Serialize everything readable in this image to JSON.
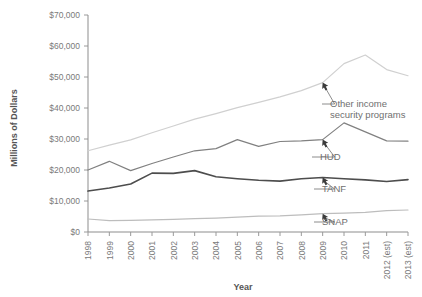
{
  "chart_data": {
    "type": "line",
    "title": "",
    "xlabel": "Year",
    "ylabel": "Millions of Dollars",
    "categories": [
      "1998",
      "1999",
      "2000",
      "2001",
      "2002",
      "2003",
      "2004",
      "2005",
      "2006",
      "2007",
      "2008",
      "2009",
      "2010",
      "2011",
      "2012 (est)",
      "2013 (est)"
    ],
    "x": [
      1998,
      1999,
      2000,
      2001,
      2002,
      2003,
      2004,
      2005,
      2006,
      2007,
      2008,
      2009,
      2010,
      2011,
      2012,
      2013
    ],
    "ylim": [
      0,
      70000
    ],
    "xlim": [
      1998,
      2013
    ],
    "ytick_labels": [
      "$0",
      "$10,000",
      "$20,000",
      "$30,000",
      "$40,000",
      "$50,000",
      "$60,000",
      "$70,000"
    ],
    "ytick_values": [
      0,
      10000,
      20000,
      30000,
      40000,
      50000,
      60000,
      70000
    ],
    "grid": false,
    "legend": "none",
    "annotations_position": "inline-callouts",
    "series": [
      {
        "name": "Other income security programs",
        "color": "#d0d0d0",
        "width": 1.2,
        "values": [
          26200,
          28000,
          29700,
          32000,
          34200,
          36400,
          38200,
          40100,
          41800,
          43600,
          45600,
          48200,
          54300,
          57100,
          52400,
          50400
        ]
      },
      {
        "name": "HUD",
        "color": "#808080",
        "width": 1.2,
        "values": [
          20000,
          22800,
          19800,
          22100,
          24200,
          26200,
          26900,
          29800,
          27600,
          29200,
          29400,
          29800,
          35200,
          32300,
          29400,
          29300
        ]
      },
      {
        "name": "TANF",
        "color": "#4d4d4d",
        "width": 1.6,
        "values": [
          13200,
          14200,
          15500,
          19000,
          18900,
          19800,
          17800,
          17200,
          16700,
          16400,
          17200,
          17600,
          17200,
          16800,
          16300,
          16900
        ]
      },
      {
        "name": "SNAP",
        "color": "#bdbdbd",
        "width": 1.2,
        "values": [
          4200,
          3700,
          3750,
          3900,
          4100,
          4300,
          4500,
          4800,
          5100,
          5200,
          5500,
          5900,
          6100,
          6300,
          6900,
          7100
        ]
      }
    ],
    "callouts": [
      {
        "name": "Other income security programs",
        "label_lines": [
          "Other income",
          "security programs"
        ],
        "anchor_year": 2009,
        "anchor_value": 48200
      },
      {
        "name": "HUD",
        "label_lines": [
          "HUD"
        ],
        "anchor_year": 2009,
        "anchor_value": 29800
      },
      {
        "name": "TANF",
        "label_lines": [
          "TANF"
        ],
        "anchor_year": 2009,
        "anchor_value": 17600
      },
      {
        "name": "SNAP",
        "label_lines": [
          "SNAP"
        ],
        "anchor_year": 2009,
        "anchor_value": 5900
      }
    ]
  }
}
